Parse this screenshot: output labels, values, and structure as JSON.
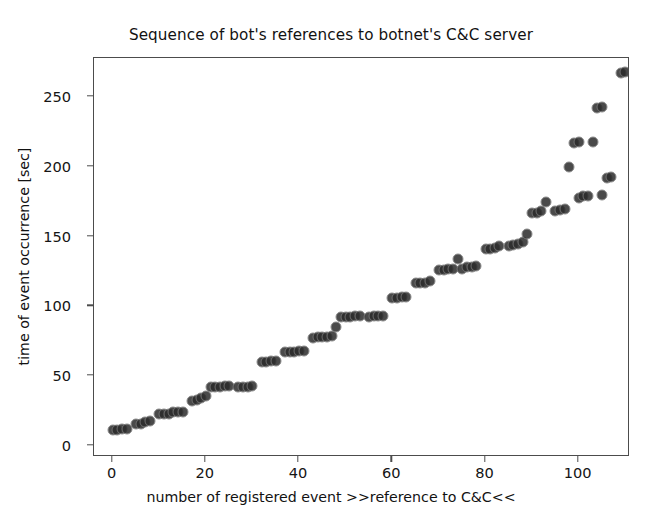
{
  "chart_data": {
    "type": "scatter",
    "title": "Sequence of bot's references to botnet's C&C server",
    "xlabel": "number of registered event >>reference to C&C<<",
    "ylabel": "time of event occurrence [sec]",
    "xlim": [
      -4,
      111
    ],
    "ylim": [
      -8,
      278
    ],
    "xticks": [
      0,
      20,
      40,
      60,
      80,
      100
    ],
    "yticks": [
      0,
      50,
      100,
      150,
      200,
      250
    ],
    "grid": false,
    "legend": false,
    "marker": {
      "shape": "circle",
      "color": "#2b2b2b",
      "edge_color": "#777777",
      "size_px": 9,
      "alpha": 0.85
    },
    "series": [
      {
        "name": "reference to C&C",
        "x": [
          0,
          1,
          2,
          3,
          5,
          6,
          7,
          8,
          10,
          11,
          12,
          13,
          14,
          15,
          17,
          18,
          19,
          21,
          22,
          23,
          24,
          25,
          27,
          28,
          29,
          30,
          32,
          33,
          34,
          35,
          37,
          38,
          39,
          40,
          41,
          43,
          44,
          45,
          46,
          47,
          49,
          50,
          51,
          52,
          53,
          55,
          56,
          57,
          58,
          60,
          61,
          62,
          63,
          65,
          66,
          67,
          68,
          70,
          71,
          72,
          73,
          75,
          76,
          77,
          78,
          80,
          81,
          82,
          83,
          85,
          86,
          87,
          88,
          90,
          91,
          92,
          95,
          96,
          97,
          100,
          101,
          102,
          105,
          106,
          107
        ],
        "y": [
          11,
          11,
          12,
          12,
          16,
          16,
          17,
          18,
          23,
          23,
          23,
          24,
          24,
          24,
          32,
          33,
          34,
          42,
          42,
          42,
          43,
          43,
          42,
          42,
          42,
          43,
          60,
          60,
          61,
          61,
          67,
          67,
          67,
          68,
          68,
          77,
          78,
          78,
          78,
          79,
          92,
          92,
          92,
          93,
          93,
          92,
          93,
          93,
          93,
          106,
          106,
          107,
          107,
          117,
          117,
          117,
          118,
          126,
          126,
          127,
          127,
          127,
          128,
          128,
          129,
          141,
          141,
          142,
          143,
          143,
          144,
          145,
          146,
          167,
          167,
          168,
          168,
          169,
          170,
          178,
          179,
          179,
          180,
          192,
          193
        ]
      },
      {
        "name": "isolated points",
        "x": [
          20,
          48,
          74,
          89,
          93,
          98,
          103
        ],
        "y": [
          36,
          85,
          134,
          152,
          175,
          200,
          218
        ]
      },
      {
        "name": "upper trail",
        "x": [
          99,
          100,
          104,
          105,
          109,
          110
        ],
        "y": [
          217,
          218,
          242,
          243,
          267,
          268
        ]
      }
    ]
  }
}
